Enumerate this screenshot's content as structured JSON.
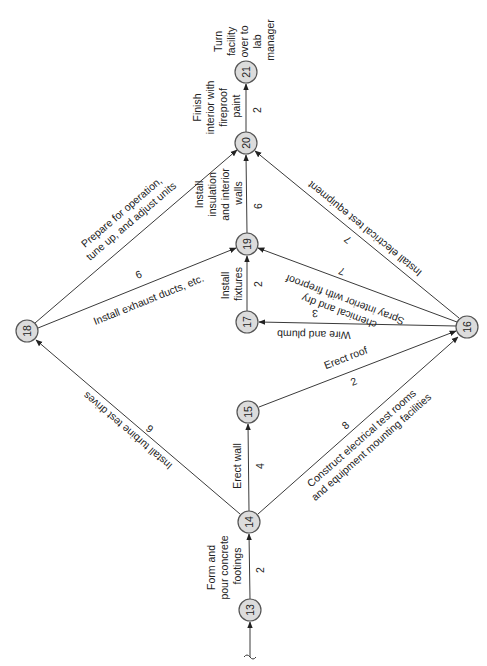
{
  "diagram": {
    "type": "activity-on-arrow network (PERT/CPM)",
    "orientation": "rotated 90 degrees counter-clockwise",
    "colors": {
      "node_fill": "#dcdcdc",
      "node_stroke": "#555555",
      "edge": "#3a3a3a",
      "text": "#222222"
    },
    "nodes": [
      {
        "id": "13",
        "label": "13"
      },
      {
        "id": "14",
        "label": "14"
      },
      {
        "id": "15",
        "label": "15"
      },
      {
        "id": "16",
        "label": "16"
      },
      {
        "id": "17",
        "label": "17"
      },
      {
        "id": "18",
        "label": "18"
      },
      {
        "id": "19",
        "label": "19"
      },
      {
        "id": "20",
        "label": "20"
      },
      {
        "id": "21",
        "label": "21"
      }
    ],
    "edges": [
      {
        "from": "13",
        "to": "14",
        "activity": [
          "Form and",
          "pour concrete",
          "footings"
        ],
        "duration": "2"
      },
      {
        "from": "14",
        "to": "15",
        "activity": [
          "Erect wall"
        ],
        "duration": "4"
      },
      {
        "from": "14",
        "to": "18",
        "activity": [
          "Install turbine test drives"
        ],
        "duration": "6"
      },
      {
        "from": "14",
        "to": "16",
        "activity": [
          "Construct electrical test rooms",
          "and equipment mounting facilities"
        ],
        "duration": "8"
      },
      {
        "from": "15",
        "to": "16",
        "activity": [
          "Erect roof"
        ],
        "duration": "2"
      },
      {
        "from": "16",
        "to": "17",
        "activity": [
          "Wire and plumb"
        ],
        "duration": "3"
      },
      {
        "from": "16",
        "to": "19",
        "activity": [
          "Spray interior with fireproof",
          "chemical and dry"
        ],
        "duration": "7"
      },
      {
        "from": "16",
        "to": "20",
        "activity": [
          "Install electrical test equipment"
        ],
        "duration": "7"
      },
      {
        "from": "17",
        "to": "19",
        "activity": [
          "Install",
          "fixtures"
        ],
        "duration": "2"
      },
      {
        "from": "18",
        "to": "19",
        "activity": [
          "Install exhaust ducts, etc."
        ],
        "duration": "6"
      },
      {
        "from": "18",
        "to": "20",
        "activity": [
          "Prepare for operation,",
          "tune up, and adjust units"
        ],
        "duration": ""
      },
      {
        "from": "19",
        "to": "20",
        "activity": [
          "Install",
          "insulation",
          "and interior",
          "walls"
        ],
        "duration": "6"
      },
      {
        "from": "20",
        "to": "21",
        "activity": [
          "Finish",
          "interior with",
          "fireproof",
          "paint"
        ],
        "duration": "2"
      }
    ],
    "final_note": [
      "Turn",
      "facility",
      "over to",
      "lab",
      "manager"
    ]
  }
}
